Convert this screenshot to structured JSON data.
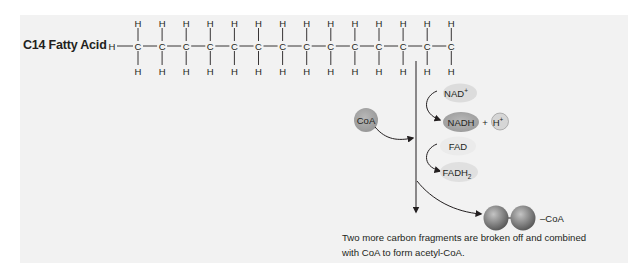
{
  "figure": {
    "molecule_label": "C14 Fatty Acid",
    "chain": {
      "carbon_count": 14,
      "terminal_atom": "H",
      "carbon_symbol": "C",
      "hydrogen_symbol": "H"
    },
    "cofactors": {
      "coa": "CoA",
      "nad_plus": "NAD",
      "nad_plus_sup": "+",
      "nadh": "NADH",
      "plus": "+",
      "h_plus": "H",
      "h_plus_sup": "+",
      "fad": "FAD",
      "fadh2": "FADH",
      "fadh2_sub": "2"
    },
    "product": {
      "suffix": "–CoA"
    },
    "caption": {
      "line1": "Two more carbon fragments are broken off and combined",
      "line2": "with CoA to form acetyl-CoA."
    },
    "colors": {
      "background_panel": "#f2f2f2",
      "nad_plus_fill": "#dcdcdc",
      "nadh_fill": "#a8a8a8",
      "fad_fill": "#ebebeb",
      "fadh2_fill": "#e0e0e0",
      "coa_fill": "#a3a3a3",
      "sphere_fill": "#8a8a8a",
      "line": "#231f20"
    }
  }
}
